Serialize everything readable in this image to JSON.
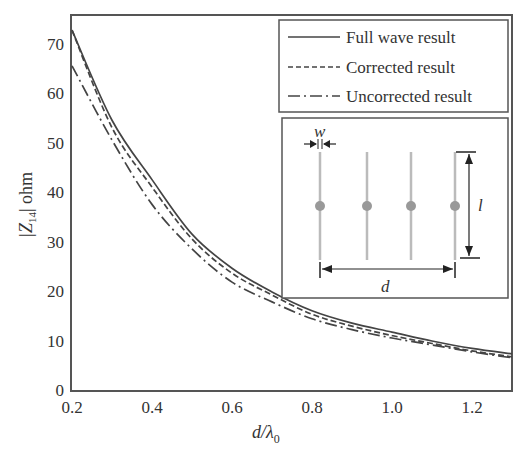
{
  "chart_data": {
    "type": "line",
    "title": "",
    "xlabel": "d/λ0",
    "ylabel": "|Z14| ohm",
    "xlim": [
      0.2,
      1.3
    ],
    "ylim": [
      0,
      75
    ],
    "grid": false,
    "legend_position": "upper right",
    "x_ticks": [
      "0.2",
      "0.4",
      "0.6",
      "0.8",
      "1.0",
      "1.2"
    ],
    "y_ticks": [
      "0",
      "10",
      "20",
      "30",
      "40",
      "50",
      "60",
      "70"
    ],
    "x": [
      0.2,
      0.3,
      0.4,
      0.5,
      0.6,
      0.7,
      0.8,
      0.9,
      1.0,
      1.1,
      1.2,
      1.3
    ],
    "series": [
      {
        "name": "Full wave result",
        "style": "solid",
        "values": [
          72.7,
          54.5,
          42.5,
          31.5,
          24.6,
          19.8,
          16.0,
          13.5,
          11.7,
          9.9,
          8.4,
          7.3
        ]
      },
      {
        "name": "Corrected result",
        "style": "dashed",
        "values": [
          72.7,
          53.0,
          41.0,
          30.5,
          23.6,
          19.2,
          15.3,
          12.9,
          11.0,
          9.4,
          7.9,
          6.7
        ]
      },
      {
        "name": "Uncorrected result",
        "style": "dashdot",
        "values": [
          65.5,
          50.5,
          37.5,
          28.5,
          21.8,
          17.8,
          14.4,
          12.2,
          10.5,
          9.1,
          7.7,
          6.5
        ]
      }
    ],
    "annotations": {
      "inset_labels": [
        "w",
        "l",
        "d"
      ],
      "inset_description": "Four parallel dipoles of width w and length l spaced with total span d"
    }
  },
  "labels": {
    "ylabel_main": "|Z",
    "ylabel_sub": "14",
    "ylabel_tail": "| ohm",
    "xlabel_main": "d/λ",
    "xlabel_sub": "0"
  },
  "legend": [
    {
      "label": "Full wave result"
    },
    {
      "label": "Corrected result"
    },
    {
      "label": "Uncorrected result"
    }
  ],
  "inset": {
    "w": "w",
    "l": "l",
    "d": "d"
  }
}
